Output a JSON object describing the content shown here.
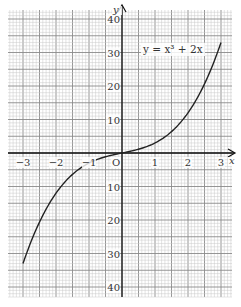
{
  "chart_data": {
    "type": "line",
    "title": "",
    "equation_label": "y = x³ + 2x",
    "xlabel": "x",
    "ylabel": "y",
    "origin_label": "O",
    "xlim": [
      -3,
      3
    ],
    "ylim": [
      -40,
      40
    ],
    "x_ticks": [
      -3,
      -2,
      -1,
      1,
      2,
      3
    ],
    "x_tick_labels": [
      "−3",
      "−2",
      "−1",
      "1",
      "2",
      "3"
    ],
    "y_ticks": [
      40,
      30,
      20,
      10,
      -10,
      -20,
      -30,
      -40
    ],
    "y_tick_labels": [
      "40",
      "30",
      "20",
      "10",
      "10",
      "20",
      "30",
      "40"
    ],
    "grid": true,
    "series": [
      {
        "name": "y = x³ + 2x",
        "x": [
          -3,
          -2.5,
          -2,
          -1.5,
          -1,
          -0.5,
          0,
          0.5,
          1,
          1.5,
          2,
          2.5,
          3
        ],
        "y": [
          -33,
          -20.6,
          -12,
          -6.4,
          -3,
          -1.1,
          0,
          1.1,
          3,
          6.4,
          12,
          20.6,
          33
        ]
      }
    ],
    "colors": {
      "curve": "#222222",
      "axis": "#111111",
      "grid_minor": "#c8c8c8",
      "grid_major": "#8a8a8a"
    }
  }
}
